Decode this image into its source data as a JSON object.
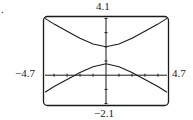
{
  "figure_label": ".",
  "window": {
    "ymax_label": "4.1",
    "ymin_label": "−2.1",
    "xmin_label": "−4.7",
    "xmax_label": "4.7"
  },
  "chart_data": {
    "type": "line",
    "title": "",
    "xlabel": "",
    "ylabel": "",
    "xlim": [
      -4.7,
      4.7
    ],
    "ylim": [
      -2.1,
      4.1
    ],
    "grid": false,
    "legend": null,
    "tick_marks": "unit spacing on both axes",
    "series": [
      {
        "name": "upper branch",
        "x": [
          -4.7,
          -4,
          -3,
          -2,
          -1,
          0,
          1,
          2,
          3,
          4,
          4.7
        ],
        "y": [
          4.0,
          3.6,
          3.1,
          2.6,
          2.2,
          2.0,
          2.2,
          2.6,
          3.1,
          3.6,
          4.0
        ]
      },
      {
        "name": "lower branch",
        "x": [
          -4.7,
          -4,
          -3,
          -2,
          -1,
          0,
          1,
          2,
          3,
          4,
          4.7
        ],
        "y": [
          -1.2,
          -0.8,
          -0.3,
          0.2,
          0.6,
          0.8,
          0.6,
          0.2,
          -0.3,
          -0.8,
          -1.2
        ]
      }
    ]
  }
}
